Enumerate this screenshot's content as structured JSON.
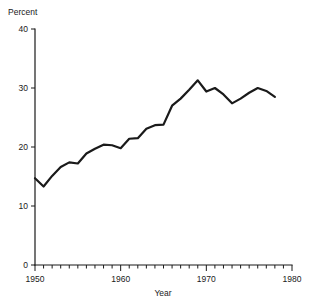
{
  "chart_data": {
    "type": "line",
    "title": "",
    "subtitle": "",
    "xlabel": "Year",
    "ylabel": "Percent",
    "ylabel_position": "above-axis",
    "xlim": [
      1950,
      1980
    ],
    "ylim": [
      0,
      40
    ],
    "grid": false,
    "legend": null,
    "line_color": "#1a1a1a",
    "x_ticks_major": [
      1950,
      1960,
      1970,
      1980
    ],
    "x_tick_labels": [
      "1950",
      "1960",
      "1970",
      "1980"
    ],
    "x_ticks_minor_step": 1,
    "y_ticks": [
      0,
      10,
      20,
      30,
      40
    ],
    "y_tick_labels": [
      "0",
      "10",
      "20",
      "30",
      "40"
    ],
    "series": [
      {
        "name": "Percent",
        "x": [
          1950,
          1951,
          1952,
          1953,
          1954,
          1955,
          1956,
          1957,
          1958,
          1959,
          1960,
          1961,
          1962,
          1963,
          1964,
          1965,
          1966,
          1967,
          1968,
          1969,
          1970,
          1971,
          1972,
          1973,
          1974,
          1975,
          1976,
          1977,
          1978
        ],
        "values": [
          14.7,
          13.3,
          15.1,
          16.6,
          17.4,
          17.2,
          18.9,
          19.7,
          20.4,
          20.3,
          19.8,
          21.4,
          21.5,
          23.1,
          23.7,
          23.8,
          27.0,
          28.2,
          29.7,
          31.3,
          29.4,
          30.0,
          28.9,
          27.4,
          28.2,
          29.2,
          30.0,
          29.5,
          28.5
        ]
      }
    ]
  },
  "plot": {
    "axis_origin_label": "0",
    "x_axis_caption": "Year",
    "y_axis_caption": "Percent"
  }
}
